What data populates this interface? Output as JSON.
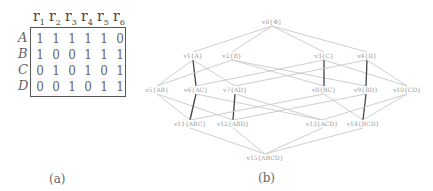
{
  "panel_a": {
    "caption": "(a)",
    "columns": [
      "r1",
      "r2",
      "r3",
      "r4",
      "r5",
      "r6"
    ],
    "rows": [
      {
        "label": "A",
        "values": [
          1,
          1,
          1,
          1,
          1,
          0
        ]
      },
      {
        "label": "B",
        "values": [
          1,
          0,
          0,
          1,
          1,
          1
        ]
      },
      {
        "label": "C",
        "values": [
          0,
          1,
          0,
          1,
          0,
          1
        ]
      },
      {
        "label": "D",
        "values": [
          0,
          0,
          1,
          0,
          1,
          1
        ]
      }
    ]
  },
  "panel_b": {
    "caption": "(b)",
    "nodes": [
      {
        "id": "v0",
        "label": "v0{Φ}",
        "x": 272,
        "y": 22
      },
      {
        "id": "v1",
        "label": "v1{A}",
        "x": 193,
        "y": 56
      },
      {
        "id": "v2",
        "label": "v2{B}",
        "x": 232,
        "y": 56
      },
      {
        "id": "v3",
        "label": "v3{C}",
        "x": 324,
        "y": 56
      },
      {
        "id": "v4",
        "label": "v4{D}",
        "x": 367,
        "y": 56
      },
      {
        "id": "v5",
        "label": "v5{AB}",
        "x": 157,
        "y": 90
      },
      {
        "id": "v6",
        "label": "v6{AC}",
        "x": 196,
        "y": 90
      },
      {
        "id": "v7",
        "label": "v7{AD}",
        "x": 235,
        "y": 90
      },
      {
        "id": "v8",
        "label": "v8{BC}",
        "x": 324,
        "y": 90
      },
      {
        "id": "v9",
        "label": "v9{BD}",
        "x": 366,
        "y": 90
      },
      {
        "id": "v10",
        "label": "v10{CD}",
        "x": 407,
        "y": 90
      },
      {
        "id": "v11",
        "label": "v11{ABC}",
        "x": 190,
        "y": 124
      },
      {
        "id": "v12",
        "label": "v12{ABD}",
        "x": 233,
        "y": 124
      },
      {
        "id": "v13",
        "label": "v13{ACD}",
        "x": 322,
        "y": 124
      },
      {
        "id": "v14",
        "label": "v14{BCD}",
        "x": 363,
        "y": 124
      },
      {
        "id": "v15",
        "label": "v15{ABCD}",
        "x": 265,
        "y": 158
      }
    ],
    "edges": [
      [
        "v0",
        "v1",
        0
      ],
      [
        "v0",
        "v2",
        0
      ],
      [
        "v0",
        "v3",
        0
      ],
      [
        "v0",
        "v4",
        0
      ],
      [
        "v1",
        "v5",
        0
      ],
      [
        "v1",
        "v6",
        1
      ],
      [
        "v1",
        "v7",
        0
      ],
      [
        "v2",
        "v5",
        0
      ],
      [
        "v2",
        "v8",
        0
      ],
      [
        "v2",
        "v9",
        0
      ],
      [
        "v3",
        "v6",
        0
      ],
      [
        "v3",
        "v8",
        1
      ],
      [
        "v3",
        "v10",
        0
      ],
      [
        "v4",
        "v7",
        0
      ],
      [
        "v4",
        "v9",
        1
      ],
      [
        "v4",
        "v10",
        0
      ],
      [
        "v5",
        "v11",
        0
      ],
      [
        "v5",
        "v12",
        0
      ],
      [
        "v6",
        "v11",
        1
      ],
      [
        "v6",
        "v13",
        0
      ],
      [
        "v7",
        "v12",
        1
      ],
      [
        "v7",
        "v13",
        0
      ],
      [
        "v8",
        "v11",
        0
      ],
      [
        "v8",
        "v14",
        0
      ],
      [
        "v9",
        "v12",
        0
      ],
      [
        "v9",
        "v14",
        1
      ],
      [
        "v10",
        "v13",
        0
      ],
      [
        "v10",
        "v14",
        0
      ],
      [
        "v11",
        "v15",
        0
      ],
      [
        "v12",
        "v15",
        0
      ],
      [
        "v13",
        "v15",
        0
      ],
      [
        "v14",
        "v15",
        0
      ]
    ]
  }
}
